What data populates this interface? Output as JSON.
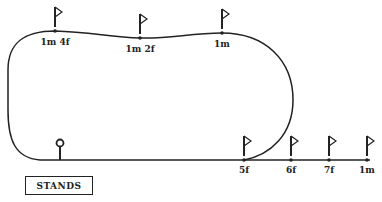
{
  "diagram": {
    "type": "racetrack-course-map",
    "colors": {
      "line": "#222222",
      "background": "#ffffff"
    },
    "stands_label": "STANDS",
    "markers_top": [
      {
        "label": "1m 4f",
        "x": 55,
        "y": 31
      },
      {
        "label": "1m 2f",
        "x": 140,
        "y": 38
      },
      {
        "label": "1m",
        "x": 222,
        "y": 33
      }
    ],
    "markers_bottom": [
      {
        "label": "5f",
        "x": 244,
        "y": 160
      },
      {
        "label": "6f",
        "x": 291,
        "y": 160
      },
      {
        "label": "7f",
        "x": 329,
        "y": 160
      },
      {
        "label": "1m",
        "x": 367,
        "y": 160
      }
    ],
    "winning_post": {
      "x": 60,
      "y": 160,
      "icon": "winning-post-icon"
    }
  }
}
